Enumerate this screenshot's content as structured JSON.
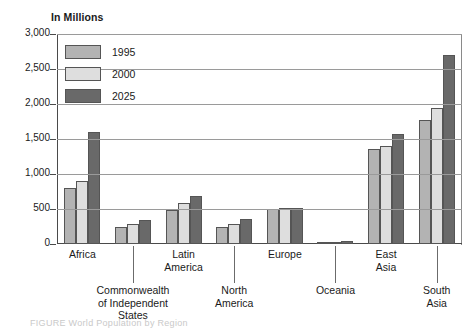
{
  "chart_data": {
    "type": "bar",
    "title": "In Millions",
    "xlabel": "",
    "ylabel": "In Millions",
    "ylim": [
      0,
      3000
    ],
    "ytick_labels": [
      "3,000",
      "2,500",
      "2,000",
      "1,500",
      "1,000",
      "500",
      "0"
    ],
    "ytick_values": [
      3000,
      2500,
      2000,
      1500,
      1000,
      500,
      0
    ],
    "grid": true,
    "legend_position": "upper-left-inside",
    "categories": [
      "Africa",
      "Commonwealth\nof Independent\nStates",
      "Latin\nAmerica",
      "North\nAmerica",
      "Europe",
      "Oceania",
      "East\nAsia",
      "South\nAsia"
    ],
    "series": [
      {
        "name": "1995",
        "color": "#b3b3b3",
        "values": [
          800,
          250,
          490,
          240,
          500,
          30,
          1360,
          1770
        ]
      },
      {
        "name": "2000",
        "color": "#dedede",
        "values": [
          900,
          290,
          590,
          290,
          510,
          35,
          1400,
          1950
        ]
      },
      {
        "name": "2025",
        "color": "#696969",
        "values": [
          1600,
          340,
          680,
          360,
          520,
          45,
          1570,
          2700
        ]
      }
    ]
  },
  "caption": "FIGURE  World Population by Region"
}
